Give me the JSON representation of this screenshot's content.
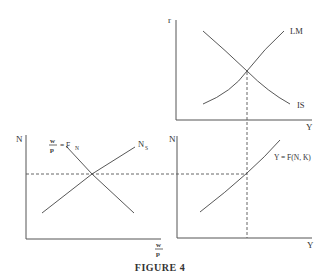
{
  "caption": "FIGURE 4",
  "panels": {
    "islm": {
      "y_axis_label": "r",
      "x_axis_label": "Y",
      "curves": [
        {
          "name": "LM",
          "label": "LM"
        },
        {
          "name": "IS",
          "label": "IS"
        }
      ]
    },
    "labor_market": {
      "y_axis_label": "N",
      "x_axis_label_num": "w",
      "x_axis_label_den": "p",
      "curves": [
        {
          "name": "labor-demand",
          "label_num": "w",
          "label_den": "p",
          "label_rhs": "= F",
          "label_sub": "N"
        },
        {
          "name": "labor-supply",
          "label": "N",
          "label_sub": "S"
        }
      ]
    },
    "production": {
      "y_axis_label": "N",
      "x_axis_label": "Y",
      "curves": [
        {
          "name": "production-function",
          "label": "Y = F(N, K)"
        }
      ]
    }
  },
  "colors": {
    "ink": "#444444",
    "background": "#ffffff"
  }
}
